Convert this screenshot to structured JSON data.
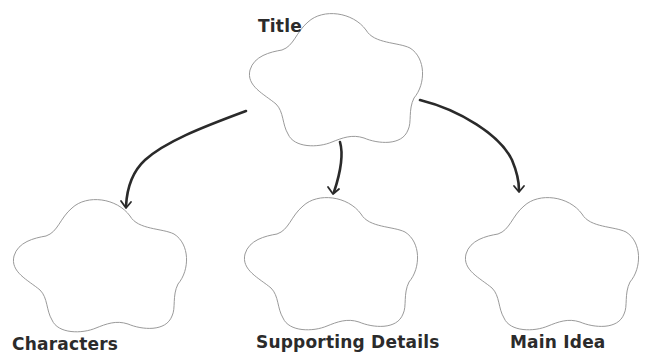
{
  "diagram": {
    "type": "graphic-organizer",
    "root": {
      "id": "title",
      "label": "Title"
    },
    "children": [
      {
        "id": "characters",
        "label": "Characters"
      },
      {
        "id": "supporting-details",
        "label": "Supporting Details"
      },
      {
        "id": "main-idea",
        "label": "Main Idea"
      }
    ],
    "edges": [
      {
        "from": "title",
        "to": "characters"
      },
      {
        "from": "title",
        "to": "supporting-details"
      },
      {
        "from": "title",
        "to": "main-idea"
      }
    ]
  },
  "colors": {
    "background": "#ffffff",
    "cloud_outline": "#9a9a9a",
    "arrow": "#2a2a2a",
    "label_text": "#2b2b2b"
  }
}
